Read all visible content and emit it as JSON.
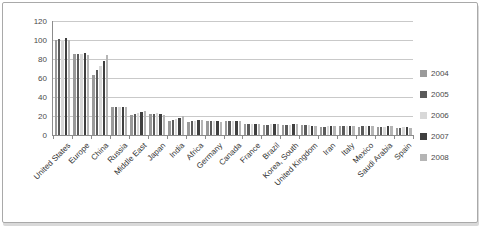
{
  "chart_data": {
    "type": "bar",
    "title": "",
    "xlabel": "",
    "ylabel": "",
    "ylim": [
      0,
      120
    ],
    "yticks": [
      0,
      20,
      40,
      60,
      80,
      100,
      120
    ],
    "grid": true,
    "legend_position": "right",
    "categories": [
      "United States",
      "Europe",
      "China",
      "Russia",
      "Middle East",
      "Japan",
      "India",
      "Africa",
      "Germany",
      "Canada",
      "France",
      "Brazil",
      "Korea, South",
      "United Kingdom",
      "Iran",
      "Italy",
      "Mexico",
      "Saudi Arabia",
      "Spain"
    ],
    "series": [
      {
        "name": "2004",
        "color": "#9a9a9a",
        "values": [
          100,
          85,
          63,
          29,
          21,
          22,
          15,
          14,
          15,
          15,
          12,
          11,
          11,
          11,
          8,
          10,
          8,
          8,
          7
        ]
      },
      {
        "name": "2005",
        "color": "#5a5a5a",
        "values": [
          101,
          85,
          68,
          29,
          22,
          22,
          16,
          15,
          15,
          15,
          12,
          11,
          11,
          11,
          8,
          10,
          9,
          8,
          7
        ]
      },
      {
        "name": "2006",
        "color": "#d8d8d8",
        "values": [
          100,
          85,
          73,
          30,
          23,
          23,
          17,
          15,
          15,
          15,
          12,
          12,
          11,
          11,
          9,
          10,
          9,
          8,
          8
        ]
      },
      {
        "name": "2007",
        "color": "#3f3f3f",
        "values": [
          102,
          86,
          78,
          30,
          24,
          22,
          18,
          16,
          15,
          15,
          12,
          12,
          12,
          10,
          9,
          10,
          9,
          9,
          8
        ]
      },
      {
        "name": "2008",
        "color": "#b5b5b5",
        "values": [
          100,
          84,
          84,
          30,
          25,
          21,
          20,
          16,
          14,
          15,
          12,
          12,
          12,
          10,
          10,
          9,
          9,
          9,
          7
        ]
      }
    ],
    "axis_colors": {
      "gridline": "#c9c9c9",
      "axis_line": "#8c8c8c",
      "tick_label": "#4a4a4a"
    }
  }
}
